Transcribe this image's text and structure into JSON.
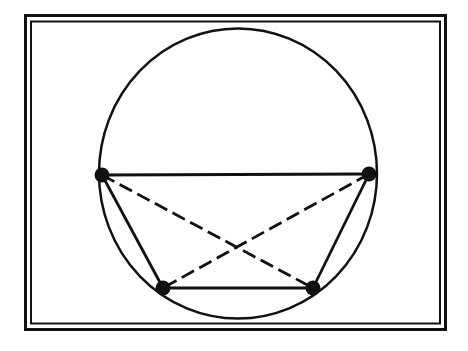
{
  "diagram": {
    "colors": {
      "stroke": "#111111",
      "background": "#ffffff"
    },
    "frame": {
      "outer": {
        "x": 25.5,
        "y": 15.5,
        "w": 420,
        "h": 314
      },
      "inner": {
        "x": 31,
        "y": 21.5,
        "w": 409,
        "h": 302
      }
    },
    "circle": {
      "cx": 238,
      "cy": 173.5,
      "rx": 139,
      "ry": 145
    },
    "points": [
      {
        "id": "A",
        "x": 102,
        "y": 175
      },
      {
        "id": "B",
        "x": 369,
        "y": 174
      },
      {
        "id": "C",
        "x": 313,
        "y": 288
      },
      {
        "id": "D",
        "x": 163,
        "y": 288
      }
    ],
    "sides": [
      [
        "A",
        "B"
      ],
      [
        "B",
        "C"
      ],
      [
        "C",
        "D"
      ],
      [
        "D",
        "A"
      ]
    ],
    "diagonals": [
      [
        "A",
        "C"
      ],
      [
        "B",
        "D"
      ]
    ]
  }
}
